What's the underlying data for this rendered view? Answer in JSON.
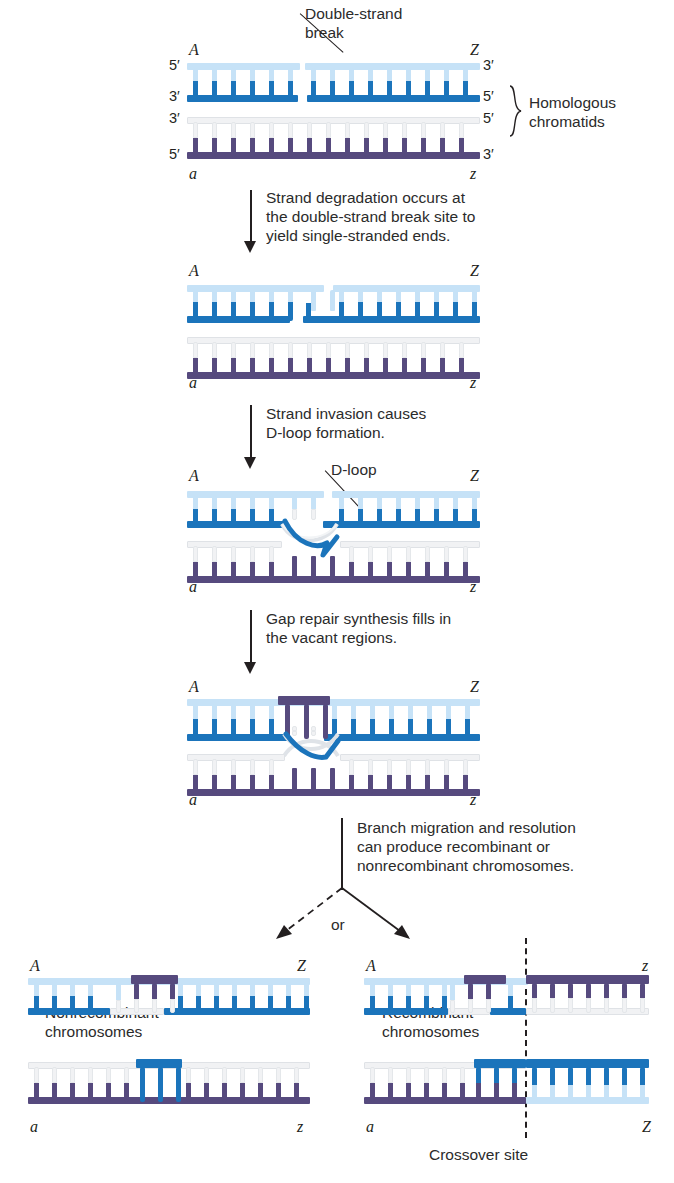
{
  "figure": {
    "callouts": {
      "double_strand_break": "Double-strand\nbreak",
      "homologous_chromatids": "Homologous\nchromatids",
      "d_loop": "D-loop",
      "crossover_site": "Crossover site",
      "or": "or",
      "nonrecombinant": "Nonrecombinant\nchromosomes",
      "recombinant": "Recombinant\nchromosomes"
    },
    "steps": [
      {
        "id": "step-1",
        "text": "Strand degradation occurs at\nthe double-strand break site to\nyield single-stranded ends."
      },
      {
        "id": "step-2",
        "text": "Strand invasion causes\nD-loop formation."
      },
      {
        "id": "step-3",
        "text": "Gap repair synthesis fills in\nthe vacant regions."
      },
      {
        "id": "step-4",
        "text": "Branch migration and resolution\ncan produce recombinant or\nnonrecombinant chromosomes."
      }
    ],
    "panels": [
      {
        "id": "panel-1",
        "gene_labels": {
          "top_left": "A",
          "top_right": "Z",
          "bottom_left": "a",
          "bottom_right": "z"
        },
        "primes": {
          "p1": "5′",
          "p2": "3′",
          "p3": "3′",
          "p4": "5′",
          "p5": "3′",
          "p6": "5′",
          "p7": "5′",
          "p8": "3′"
        }
      },
      {
        "id": "panel-2",
        "gene_labels": {
          "top_left": "A",
          "top_right": "Z",
          "bottom_left": "a",
          "bottom_right": "z"
        }
      },
      {
        "id": "panel-3",
        "gene_labels": {
          "top_left": "A",
          "top_right": "Z",
          "bottom_left": "a",
          "bottom_right": "z"
        }
      },
      {
        "id": "panel-4",
        "gene_labels": {
          "top_left": "A",
          "top_right": "Z",
          "bottom_left": "a",
          "bottom_right": "z"
        }
      },
      {
        "id": "panel-5-nonrecombinant",
        "gene_labels": {
          "top_left": "A",
          "top_right": "Z",
          "bottom_left": "a",
          "bottom_right": "z"
        }
      },
      {
        "id": "panel-6-recombinant",
        "gene_labels": {
          "top_left": "A",
          "top_right": "z",
          "bottom_left": "a",
          "bottom_right": "Z"
        }
      }
    ],
    "colors": {
      "light_blue": "#c6e2f7",
      "dark_blue": "#1b74bb",
      "light_gray": "#f1f2f4",
      "dark_purple": "#564a7e",
      "ink": "#231f20"
    }
  }
}
